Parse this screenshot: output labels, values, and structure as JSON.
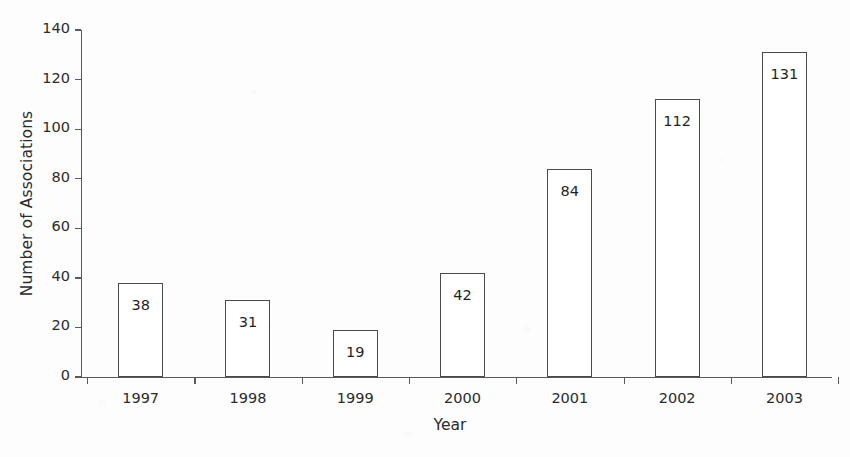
{
  "chart_data": {
    "type": "bar",
    "title": "",
    "xlabel": "Year",
    "ylabel": "Number of Associations",
    "categories": [
      "1997",
      "1998",
      "1999",
      "2000",
      "2001",
      "2002",
      "2003"
    ],
    "values": [
      38,
      31,
      19,
      42,
      84,
      112,
      131
    ],
    "data_labels": [
      "38",
      "31",
      "19",
      "42",
      "84",
      "112",
      "131"
    ],
    "ylim": [
      0,
      140
    ],
    "ytick_labels": [
      "0",
      "20",
      "40",
      "60",
      "80",
      "100",
      "120",
      "140"
    ],
    "ytick_values": [
      0,
      20,
      40,
      60,
      80,
      100,
      120,
      140
    ],
    "grid": false,
    "legend": false,
    "legend_position": "none",
    "bar_fill_color": "#ffffff",
    "bar_edge_color": "#4a4a4a",
    "axis_color": "#5a5a5a",
    "text_color": "#2b2b2b",
    "background_color": "#fdfdfd"
  }
}
